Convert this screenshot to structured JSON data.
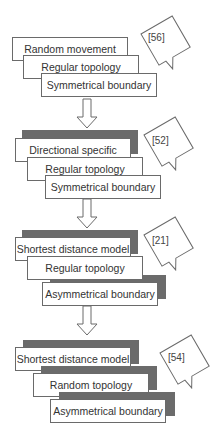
{
  "stages": [
    {
      "citation": "[56]",
      "boxes": [
        {
          "label": "Random movement",
          "shadow": false
        },
        {
          "label": "Regular topology",
          "shadow": false
        },
        {
          "label": "Symmetrical boundary",
          "shadow": false
        }
      ]
    },
    {
      "citation": "[52]",
      "boxes": [
        {
          "label": "Directional specific",
          "shadow": true
        },
        {
          "label": "Regular topology",
          "shadow": false
        },
        {
          "label": "Symmetrical boundary",
          "shadow": false
        }
      ]
    },
    {
      "citation": "[21]",
      "boxes": [
        {
          "label": "Shortest distance model",
          "shadow": true
        },
        {
          "label": "Regular topology",
          "shadow": false
        },
        {
          "label": "Asymmetrical boundary",
          "shadow": true
        }
      ]
    },
    {
      "citation": "[54]",
      "boxes": [
        {
          "label": "Shortest distance model",
          "shadow": true
        },
        {
          "label": "Random topology",
          "shadow": true
        },
        {
          "label": "Asymmetrical boundary",
          "shadow": true
        }
      ]
    }
  ],
  "colors": {
    "shadow": "#6b6b6b",
    "border": "#6a6a6a",
    "text": "#333333"
  }
}
